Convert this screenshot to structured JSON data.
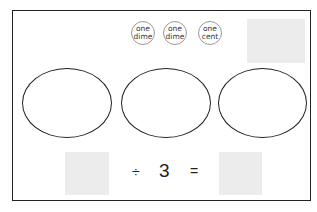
{
  "coins": [
    {
      "line1": "one",
      "line2": "dime"
    },
    {
      "line1": "one",
      "line2": "dime"
    },
    {
      "line1": "one",
      "line2": "cent"
    }
  ],
  "equation": {
    "operator": "÷",
    "divisor": "3",
    "equals": "="
  },
  "groups": 3
}
